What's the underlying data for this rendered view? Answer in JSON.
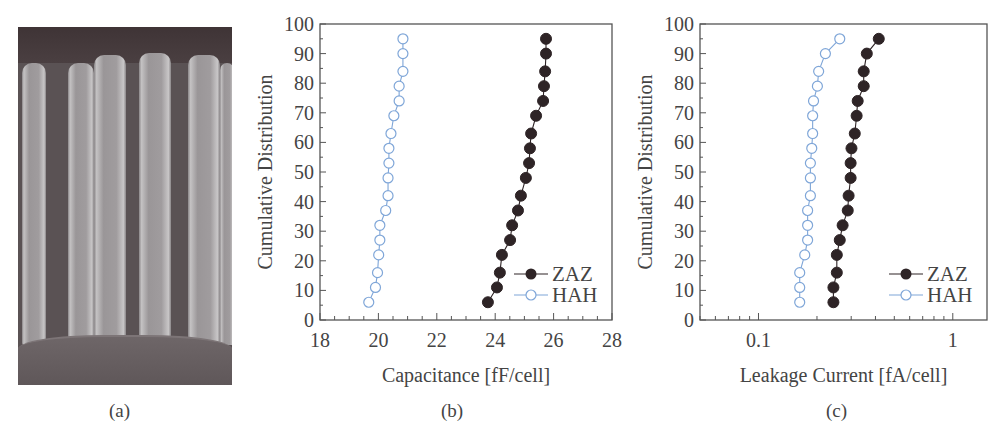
{
  "panels": {
    "a": {
      "caption": "(a)",
      "description": "SEM cross-section image of capacitor cell array"
    },
    "b": {
      "caption": "(b)"
    },
    "c": {
      "caption": "(c)"
    }
  },
  "colors": {
    "ZAZ": "#2e2426",
    "HAH": "#7fa6d8",
    "axis": "#555555"
  },
  "chart_data": [
    {
      "panel": "b",
      "type": "line",
      "title": "",
      "xlabel": "Capacitance [fF/cell]",
      "ylabel": "Cumulative Distribution",
      "xlim": [
        18,
        28
      ],
      "ylim": [
        0,
        100
      ],
      "xscale": "linear",
      "xticks": [
        "18",
        "20",
        "22",
        "24",
        "26",
        "28"
      ],
      "yticks": [
        "0",
        "10",
        "20",
        "30",
        "40",
        "50",
        "60",
        "70",
        "80",
        "90",
        "100"
      ],
      "grid": false,
      "legend_position": "lower right",
      "y": [
        6,
        11,
        16,
        22,
        27,
        32,
        37,
        42,
        48,
        53,
        58,
        63,
        69,
        74,
        79,
        84,
        90,
        95
      ],
      "series": [
        {
          "name": "ZAZ",
          "marker": "filled-circle",
          "x": [
            23.75,
            24.06,
            24.16,
            24.23,
            24.51,
            24.58,
            24.78,
            24.88,
            25.05,
            25.16,
            25.19,
            25.23,
            25.4,
            25.64,
            25.67,
            25.71,
            25.74,
            25.74
          ]
        },
        {
          "name": "HAH",
          "marker": "open-circle",
          "x": [
            19.67,
            19.9,
            19.97,
            20.01,
            20.05,
            20.05,
            20.25,
            20.33,
            20.33,
            20.36,
            20.36,
            20.43,
            20.53,
            20.71,
            20.71,
            20.84,
            20.84,
            20.84
          ]
        }
      ]
    },
    {
      "panel": "c",
      "type": "line",
      "title": "",
      "xlabel": "Leakage Current [fA/cell]",
      "ylabel": "Cumulative Distribution",
      "xlim": [
        0.05,
        1.5
      ],
      "ylim": [
        0,
        100
      ],
      "xscale": "log",
      "xticks": [
        "0.1",
        "1"
      ],
      "yticks": [
        "0",
        "10",
        "20",
        "30",
        "40",
        "50",
        "60",
        "70",
        "80",
        "90",
        "100"
      ],
      "grid": false,
      "legend_position": "lower right",
      "y": [
        6,
        11,
        16,
        22,
        27,
        32,
        37,
        42,
        48,
        53,
        58,
        63,
        69,
        74,
        79,
        84,
        90,
        95
      ],
      "series": [
        {
          "name": "ZAZ",
          "marker": "filled-circle",
          "x": [
            0.243,
            0.243,
            0.253,
            0.253,
            0.262,
            0.271,
            0.288,
            0.291,
            0.298,
            0.298,
            0.301,
            0.313,
            0.32,
            0.324,
            0.348,
            0.348,
            0.361,
            0.416
          ]
        },
        {
          "name": "HAH",
          "marker": "open-circle",
          "x": [
            0.163,
            0.163,
            0.163,
            0.173,
            0.179,
            0.179,
            0.179,
            0.185,
            0.185,
            0.185,
            0.188,
            0.19,
            0.19,
            0.192,
            0.201,
            0.204,
            0.221,
            0.262,
            0.327
          ]
        }
      ]
    }
  ]
}
